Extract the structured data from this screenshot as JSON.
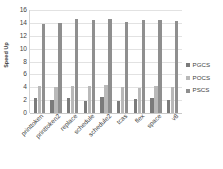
{
  "chart_data": {
    "type": "bar",
    "title": "",
    "xlabel": "",
    "ylabel": "Speed Up",
    "ylim": [
      0,
      16
    ],
    "yticks": [
      0,
      2,
      4,
      6,
      8,
      10,
      12,
      14,
      16
    ],
    "grid": true,
    "legend_position": "right",
    "categories": [
      "printtoken",
      "printtoken2",
      "replace",
      "schedule",
      "schedule2",
      "tcas",
      "flex",
      "space",
      "v8"
    ],
    "series": [
      {
        "name": "PGCS",
        "color": "#7b7b7b",
        "values": [
          2.4,
          2.0,
          2.3,
          1.9,
          2.5,
          1.9,
          2.2,
          2.4,
          2.0
        ]
      },
      {
        "name": "POCS",
        "color": "#b9b9b9",
        "values": [
          4.2,
          4.1,
          4.2,
          4.2,
          4.3,
          4.1,
          3.9,
          4.2,
          4.1
        ]
      },
      {
        "name": "PSCS",
        "color": "#8f8f8f",
        "values": [
          13.8,
          14.0,
          14.6,
          14.4,
          14.6,
          14.2,
          14.5,
          14.4,
          14.3
        ]
      }
    ]
  }
}
